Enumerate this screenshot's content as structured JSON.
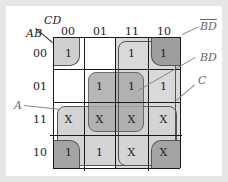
{
  "axes": {
    "corner_top": "CD",
    "corner_left": "AB",
    "columns": [
      "00",
      "01",
      "11",
      "10"
    ],
    "rows": [
      "00",
      "01",
      "11",
      "10"
    ]
  },
  "cells": [
    [
      "1",
      "",
      "1",
      "1"
    ],
    [
      "",
      "1",
      "1",
      "1"
    ],
    [
      "X",
      "X",
      "X",
      "X"
    ],
    [
      "1",
      "1",
      "X",
      "X"
    ]
  ],
  "groups": [
    {
      "label": "BD",
      "overline": true,
      "display": "BD",
      "color": "#9a9a9a"
    },
    {
      "label": "BD",
      "overline": false,
      "display": "BD",
      "color": "#a8a8a8"
    },
    {
      "label": "C",
      "display": "C",
      "color": "#c8c8c8"
    },
    {
      "label": "A",
      "display": "A",
      "color": "#d6d6d6"
    }
  ],
  "colors": {
    "background": "#e6e6e6",
    "panel": "#ffffff",
    "grid_line": "#1a1a1a",
    "light_group": "#dcdcdc",
    "dark_group": "#a9a9a9"
  }
}
